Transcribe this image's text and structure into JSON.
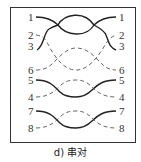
{
  "figure": {
    "caption": "d) 串对",
    "colors": {
      "solid_wire": "#222222",
      "dashed_wire": "#555555",
      "frame": "#333333",
      "label": "#333333"
    },
    "labels_left": [
      "1",
      "2",
      "3",
      "6",
      "5",
      "4",
      "7",
      "8"
    ],
    "labels_right": [
      "1",
      "2",
      "3",
      "6",
      "5",
      "4",
      "7",
      "8"
    ],
    "wires": [
      {
        "id": "1",
        "style": "solid"
      },
      {
        "id": "2",
        "style": "dashed"
      },
      {
        "id": "3",
        "style": "solid"
      },
      {
        "id": "6",
        "style": "dashed"
      },
      {
        "id": "5",
        "style": "solid"
      },
      {
        "id": "4",
        "style": "dashed"
      },
      {
        "id": "7",
        "style": "solid"
      },
      {
        "id": "8",
        "style": "dashed"
      }
    ]
  }
}
